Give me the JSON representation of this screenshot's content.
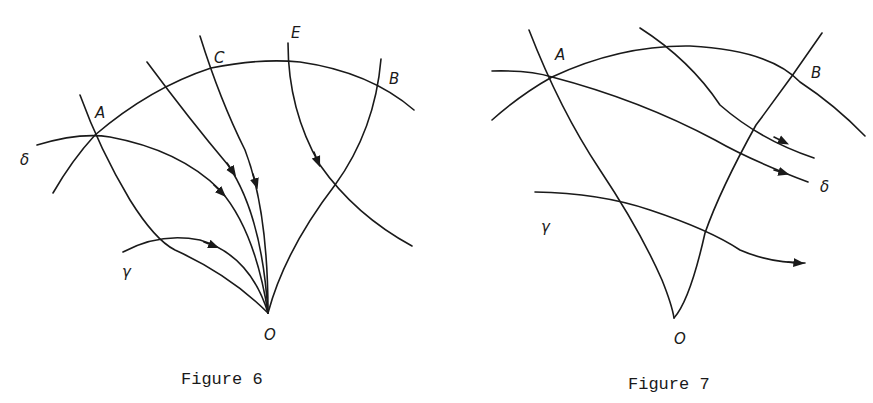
{
  "figures": [
    {
      "caption": "Figure 6",
      "labels": {
        "A": "A",
        "B": "B",
        "C": "C",
        "E": "E",
        "O": "O",
        "delta": "δ",
        "gamma": "γ"
      }
    },
    {
      "caption": "Figure 7",
      "labels": {
        "A": "A",
        "B": "B",
        "O": "O",
        "delta": "δ",
        "gamma": "γ"
      }
    }
  ],
  "colors": {
    "ink": "#1a1a1a",
    "background": "#ffffff"
  }
}
